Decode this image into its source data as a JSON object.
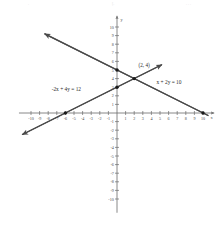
{
  "chart_data": {
    "type": "line",
    "title": "",
    "xlabel": "x",
    "ylabel": "y",
    "xlim": [
      -11,
      11
    ],
    "ylim": [
      -11,
      11
    ],
    "grid": false,
    "axis_arrows": true,
    "x_ticks": [
      -10,
      -9,
      -8,
      -7,
      -6,
      -5,
      -4,
      -3,
      -2,
      -1,
      1,
      2,
      3,
      4,
      5,
      6,
      7,
      8,
      9,
      10
    ],
    "y_ticks": [
      10,
      9,
      8,
      7,
      6,
      5,
      4,
      3,
      2,
      1,
      -1,
      -2,
      -3,
      -4,
      -5,
      -6,
      -7,
      -8,
      -9,
      -10
    ],
    "series": [
      {
        "name": "-2x + 4y = 12",
        "label": "-2x + 4y = 12",
        "label_x": -7.6,
        "label_y": 2.6,
        "slope": 0.5,
        "intercept": 3,
        "from": [
          -11,
          -2.5
        ],
        "to": [
          5.2,
          5.6
        ],
        "arrow_start": true,
        "arrow_end": true,
        "points": [
          {
            "x": -6,
            "y": 0
          },
          {
            "x": 0,
            "y": 3
          },
          {
            "x": 2,
            "y": 4
          }
        ]
      },
      {
        "name": "x + 2y = 10",
        "label": "x + 2y = 10",
        "label_x": 4.6,
        "label_y": 3.4,
        "slope": -0.5,
        "intercept": 5,
        "from": [
          -8.4,
          9.2
        ],
        "to": [
          10.6,
          -0.3
        ],
        "arrow_start": true,
        "arrow_end": false,
        "points": [
          {
            "x": 0,
            "y": 5
          },
          {
            "x": 2,
            "y": 4
          },
          {
            "x": 10,
            "y": 0
          }
        ]
      }
    ],
    "intersection": {
      "x": 2,
      "y": 4,
      "label": "(2, 4)",
      "label_x": 2.5,
      "label_y": 5.4
    },
    "line_color": "#4a4a4a",
    "axis_color": "#6b6b6b",
    "point_color": "#1a1a1a"
  },
  "axis": {
    "x_name": "x",
    "y_name": "y"
  },
  "top_faint_marks": [
    {
      "text": ".",
      "left": 28
    },
    {
      "text": "[.",
      "left": 112
    },
    {
      "text": ". . .",
      "left": 186
    }
  ]
}
